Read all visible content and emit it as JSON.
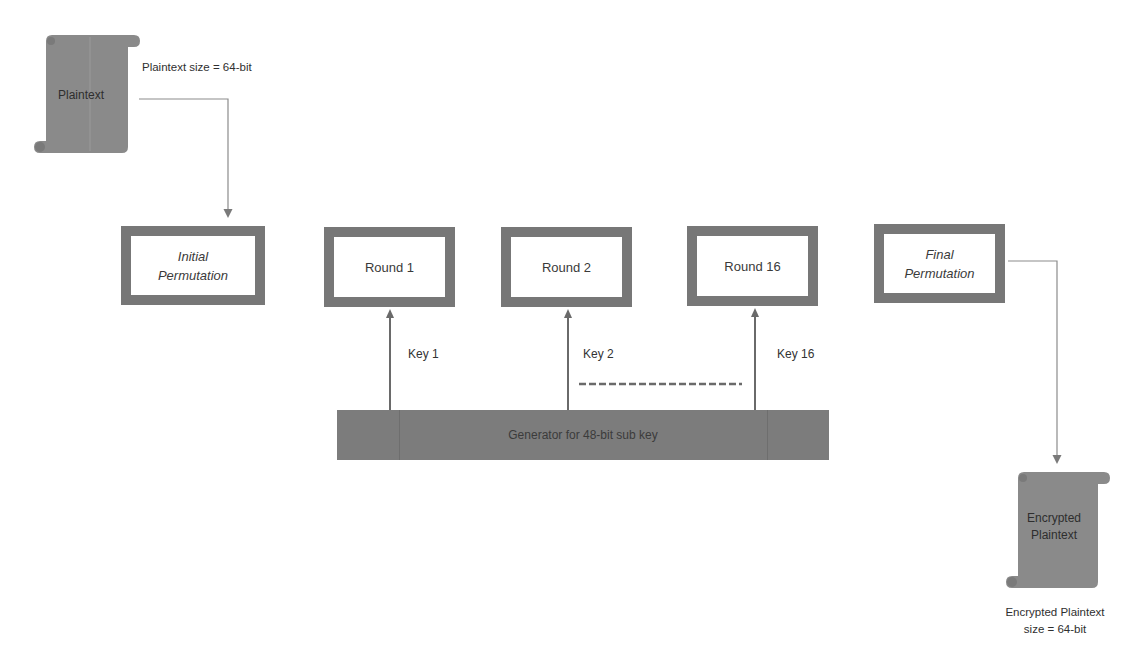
{
  "diagram": {
    "input": {
      "scroll_label": "Plaintext",
      "size_caption": "Plaintext size = 64-bit"
    },
    "stages": [
      {
        "id": "initial-permutation",
        "line1": "Initial",
        "line2": "Permutation",
        "italic": true
      },
      {
        "id": "round-1",
        "line1": "Round 1",
        "line2": "",
        "italic": false
      },
      {
        "id": "round-2",
        "line1": "Round 2",
        "line2": "",
        "italic": false
      },
      {
        "id": "round-16",
        "line1": "Round 16",
        "line2": "",
        "italic": false
      },
      {
        "id": "final-permutation",
        "line1": "Final",
        "line2": "Permutation",
        "italic": true
      }
    ],
    "keys": [
      {
        "label": "Key 1",
        "target": "round-1"
      },
      {
        "label": "Key 2",
        "target": "round-2"
      },
      {
        "label": "Key 16",
        "target": "round-16"
      }
    ],
    "ellipsis_indicator": "dashed",
    "key_generator": {
      "label": "Generator for 48-bit sub key"
    },
    "output": {
      "scroll_line1": "Encrypted",
      "scroll_line2": "Plaintext",
      "caption_line1": "Encrypted Plaintext",
      "caption_line2": "size = 64-bit"
    },
    "colors": {
      "box_border": "#777777",
      "generator_fill": "#7c7c7c",
      "scroll_fill": "#8a8a8a",
      "connector": "#8c8c8c",
      "key_arrow": "#6a6a6a"
    }
  }
}
